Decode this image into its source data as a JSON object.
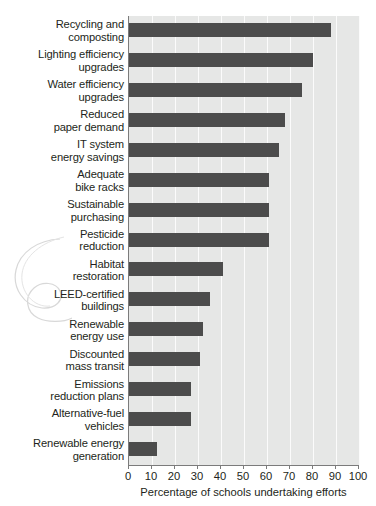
{
  "chart_data": {
    "type": "bar",
    "orientation": "horizontal",
    "title": "",
    "xlabel": "Percentage of schools undertaking efforts",
    "ylabel": "",
    "xlim": [
      0,
      100
    ],
    "xticks": [
      0,
      10,
      20,
      30,
      40,
      50,
      60,
      70,
      80,
      90,
      100
    ],
    "xticklabels": [
      "0",
      "10",
      "20",
      "30",
      "40",
      "50",
      "60",
      "70",
      "80",
      "90",
      "100"
    ],
    "grid": "vertical-white-gridlines",
    "legend": "none",
    "bar_color": "#4c4c4c",
    "plot_background": "#e6e7e6",
    "categories": [
      "Recycling and composting",
      "Lighting efficiency upgrades",
      "Water efficiency upgrades",
      "Reduced paper demand",
      "IT system energy savings",
      "Adequate bike racks",
      "Sustainable purchasing",
      "Pesticide reduction",
      "Habitat restoration",
      "LEED-certified buildings",
      "Renewable energy use",
      "Discounted mass transit",
      "Emissions reduction plans",
      "Alternative-fuel vehicles",
      "Renewable energy generation"
    ],
    "category_lines": [
      [
        "Recycling and",
        "composting"
      ],
      [
        "Lighting efficiency",
        "upgrades"
      ],
      [
        "Water efficiency",
        "upgrades"
      ],
      [
        "Reduced",
        "paper demand"
      ],
      [
        "IT system",
        "energy savings"
      ],
      [
        "Adequate",
        "bike racks"
      ],
      [
        "Sustainable",
        "purchasing"
      ],
      [
        "Pesticide",
        "reduction"
      ],
      [
        "Habitat",
        "restoration"
      ],
      [
        "LEED-certified",
        "buildings"
      ],
      [
        "Renewable",
        "energy use"
      ],
      [
        "Discounted",
        "mass transit"
      ],
      [
        "Emissions",
        "reduction plans"
      ],
      [
        "Alternative-fuel",
        "vehicles"
      ],
      [
        "Renewable energy",
        "generation"
      ]
    ],
    "values": [
      88,
      80,
      75,
      68,
      65,
      61,
      61,
      61,
      41,
      35,
      32,
      31,
      27,
      27,
      12
    ]
  }
}
